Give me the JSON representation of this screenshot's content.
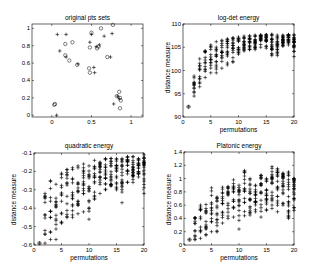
{
  "chart_data": [
    {
      "type": "scatter",
      "title": "original pts sets",
      "xlabel": "",
      "ylabel": "",
      "xlim": [
        -0.25,
        1.15
      ],
      "ylim": [
        -0.02,
        1.05
      ],
      "xticks": [
        "0",
        "0.5",
        "1"
      ],
      "yticks": [
        "0",
        "0.2",
        "0.4",
        "0.6",
        "0.8",
        "1"
      ],
      "grid": false,
      "series": [
        {
          "name": "set A (circles)",
          "marker": "o",
          "points": [
            [
              0.03,
              0.12
            ],
            [
              0.04,
              0.13
            ],
            [
              0.17,
              0.82
            ],
            [
              0.26,
              0.84
            ],
            [
              0.17,
              0.69
            ],
            [
              0.22,
              0.63
            ],
            [
              0.32,
              0.58
            ],
            [
              0.47,
              0.54
            ],
            [
              0.48,
              0.78
            ],
            [
              0.5,
              0.95
            ],
            [
              0.57,
              0.77
            ],
            [
              0.59,
              0.79
            ],
            [
              0.62,
              1.0
            ],
            [
              0.7,
              0.67
            ],
            [
              0.77,
              1.04
            ],
            [
              0.85,
              0.27
            ],
            [
              0.86,
              0.2
            ],
            [
              0.87,
              0.17
            ],
            [
              0.86,
              0.08
            ],
            [
              0.82,
              0.22
            ],
            [
              0.48,
              0.49
            ]
          ]
        },
        {
          "name": "set B (crosses)",
          "marker": "+",
          "points": [
            [
              0.06,
              0.0
            ],
            [
              0.07,
              0.93
            ],
            [
              0.18,
              0.93
            ],
            [
              0.1,
              0.74
            ],
            [
              0.18,
              0.67
            ],
            [
              0.33,
              0.59
            ],
            [
              0.48,
              0.84
            ],
            [
              0.53,
              0.55
            ],
            [
              0.54,
              0.49
            ],
            [
              0.56,
              0.79
            ],
            [
              0.6,
              0.81
            ],
            [
              0.66,
              0.91
            ],
            [
              0.76,
              0.94
            ],
            [
              0.74,
              0.67
            ],
            [
              0.78,
              0.13
            ],
            [
              0.83,
              0.22
            ],
            [
              0.85,
              0.19
            ],
            [
              0.5,
              0.93
            ]
          ]
        }
      ]
    },
    {
      "type": "scatter",
      "title": "log-det energy",
      "xlabel": "permutations",
      "ylabel": "distance measure",
      "xlim": [
        0,
        20
      ],
      "ylim": [
        90,
        110
      ],
      "xticks": [
        "0",
        "5",
        "10",
        "15",
        "20"
      ],
      "yticks": [
        "90",
        "95",
        "100",
        "105",
        "110"
      ],
      "grid": false,
      "columns": [
        {
          "x": 1,
          "min": 92.2,
          "max": 92.2
        },
        {
          "x": 2,
          "min": 94.5,
          "max": 98.8
        },
        {
          "x": 3,
          "min": 96.5,
          "max": 102.5
        },
        {
          "x": 4,
          "min": 98.5,
          "max": 104.2
        },
        {
          "x": 5,
          "min": 99.5,
          "max": 105.5
        },
        {
          "x": 6,
          "min": 99.5,
          "max": 106.2
        },
        {
          "x": 7,
          "min": 100.5,
          "max": 106.5
        },
        {
          "x": 8,
          "min": 101.2,
          "max": 106.8
        },
        {
          "x": 9,
          "min": 101.8,
          "max": 107.0
        },
        {
          "x": 10,
          "min": 103.5,
          "max": 107.2
        },
        {
          "x": 11,
          "min": 104.2,
          "max": 107.4
        },
        {
          "x": 12,
          "min": 104.5,
          "max": 107.5
        },
        {
          "x": 13,
          "min": 104.5,
          "max": 107.6
        },
        {
          "x": 14,
          "min": 105.0,
          "max": 107.6
        },
        {
          "x": 15,
          "min": 104.8,
          "max": 107.7
        },
        {
          "x": 16,
          "min": 103.2,
          "max": 107.8
        },
        {
          "x": 17,
          "min": 103.2,
          "max": 107.6
        },
        {
          "x": 18,
          "min": 105.2,
          "max": 107.6
        },
        {
          "x": 19,
          "min": 105.5,
          "max": 107.7
        },
        {
          "x": 20,
          "min": 103.0,
          "max": 107.7
        }
      ]
    },
    {
      "type": "scatter",
      "title": "quadratic energy",
      "xlabel": "permutations",
      "ylabel": "distance measure",
      "xlim": [
        0,
        20
      ],
      "ylim": [
        -0.6,
        -0.1
      ],
      "xticks": [
        "0",
        "5",
        "10",
        "15",
        "20"
      ],
      "yticks": [
        "-0.6",
        "-0.5",
        "-0.4",
        "-0.3",
        "-0.2",
        "-0.1"
      ],
      "grid": false,
      "columns": [
        {
          "x": 1,
          "min": -0.59,
          "max": -0.59
        },
        {
          "x": 2,
          "min": -0.59,
          "max": -0.32
        },
        {
          "x": 3,
          "min": -0.57,
          "max": -0.25
        },
        {
          "x": 4,
          "min": -0.57,
          "max": -0.27
        },
        {
          "x": 5,
          "min": -0.48,
          "max": -0.21
        },
        {
          "x": 6,
          "min": -0.45,
          "max": -0.19
        },
        {
          "x": 7,
          "min": -0.45,
          "max": -0.18
        },
        {
          "x": 8,
          "min": -0.43,
          "max": -0.17
        },
        {
          "x": 9,
          "min": -0.42,
          "max": -0.16
        },
        {
          "x": 10,
          "min": -0.46,
          "max": -0.17
        },
        {
          "x": 11,
          "min": -0.35,
          "max": -0.14
        },
        {
          "x": 12,
          "min": -0.32,
          "max": -0.15
        },
        {
          "x": 13,
          "min": -0.3,
          "max": -0.13
        },
        {
          "x": 14,
          "min": -0.28,
          "max": -0.13
        },
        {
          "x": 15,
          "min": -0.3,
          "max": -0.13
        },
        {
          "x": 16,
          "min": -0.37,
          "max": -0.13
        },
        {
          "x": 17,
          "min": -0.26,
          "max": -0.12
        },
        {
          "x": 18,
          "min": -0.26,
          "max": -0.12
        },
        {
          "x": 19,
          "min": -0.23,
          "max": -0.13
        },
        {
          "x": 20,
          "min": -0.32,
          "max": -0.11
        }
      ]
    },
    {
      "type": "scatter",
      "title": "Platonic energy",
      "xlabel": "permutations",
      "ylabel": "distance measure",
      "xlim": [
        0,
        20
      ],
      "ylim": [
        0,
        1.4
      ],
      "xticks": [
        "0",
        "5",
        "10",
        "15",
        "20"
      ],
      "yticks": [
        "0",
        "0.2",
        "0.4",
        "0.6",
        "0.8",
        "1",
        "1.2",
        "1.4"
      ],
      "grid": false,
      "columns": [
        {
          "x": 1,
          "min": 0.08,
          "max": 0.08
        },
        {
          "x": 2,
          "min": 0.08,
          "max": 0.41
        },
        {
          "x": 3,
          "min": 0.1,
          "max": 0.6
        },
        {
          "x": 4,
          "min": 0.15,
          "max": 0.61
        },
        {
          "x": 5,
          "min": 0.2,
          "max": 0.86
        },
        {
          "x": 6,
          "min": 0.2,
          "max": 0.72
        },
        {
          "x": 7,
          "min": 0.33,
          "max": 0.87
        },
        {
          "x": 8,
          "min": 0.4,
          "max": 0.88
        },
        {
          "x": 9,
          "min": 0.42,
          "max": 0.98
        },
        {
          "x": 10,
          "min": 0.24,
          "max": 0.9
        },
        {
          "x": 11,
          "min": 0.44,
          "max": 1.12
        },
        {
          "x": 12,
          "min": 0.45,
          "max": 1.0
        },
        {
          "x": 13,
          "min": 0.5,
          "max": 0.9
        },
        {
          "x": 14,
          "min": 0.42,
          "max": 1.05
        },
        {
          "x": 15,
          "min": 0.52,
          "max": 1.0
        },
        {
          "x": 16,
          "min": 0.55,
          "max": 1.18
        },
        {
          "x": 17,
          "min": 0.5,
          "max": 1.15
        },
        {
          "x": 18,
          "min": 0.6,
          "max": 1.08
        },
        {
          "x": 19,
          "min": 0.4,
          "max": 1.1
        },
        {
          "x": 20,
          "min": 0.52,
          "max": 1.0
        }
      ]
    }
  ],
  "panels": [
    {
      "title": "original pts sets",
      "xlabel": "",
      "ylabel": ""
    },
    {
      "title": "log-det energy",
      "xlabel": "permutations",
      "ylabel": "distance measure"
    },
    {
      "title": "quadratic energy",
      "xlabel": "permutations",
      "ylabel": "distance measure"
    },
    {
      "title": "Platonic energy",
      "xlabel": "permutations",
      "ylabel": "distance measure"
    }
  ]
}
